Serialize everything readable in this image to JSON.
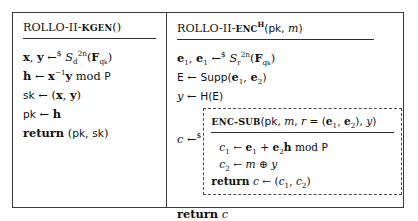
{
  "figure": {
    "kind": "algorithm-pseudocode-figure",
    "columns": [
      {
        "id": "kgen",
        "header": {
          "name": "ROLLO-II-KGen",
          "small_caps_part": "KGen",
          "args": "()",
          "full": "ROLLO-II-KGen()"
        },
        "lines": [
          {
            "id": "sample-xy",
            "text": "x, y ←$ S_d^{2n}(F_{q^k})"
          },
          {
            "id": "compute-h",
            "text": "h ← x^{-1}y mod P"
          },
          {
            "id": "set-sk",
            "text": "sk ← (x, y)"
          },
          {
            "id": "set-pk",
            "text": "pk ← h"
          },
          {
            "id": "return-keys",
            "text": "return (pk, sk)"
          }
        ]
      },
      {
        "id": "enc",
        "header": {
          "name": "ROLLO-II-Enc",
          "small_caps_part": "Enc",
          "superscript": "H",
          "args": "(pk, m)",
          "full": "ROLLO-II-Enc^H(pk, m)"
        },
        "lines": [
          {
            "id": "sample-e",
            "text": "e₁, e₁ ←$ S_r^{2n}(F_{q^k})"
          },
          {
            "id": "compute-E",
            "text": "E ← Supp(e₁, e₂)"
          },
          {
            "id": "compute-y",
            "text": "y ← H(E)"
          }
        ],
        "enc_sub": {
          "assign": "c ←$",
          "header": "Enc-Sub(pk, m, r = (e₁, e₂), y)",
          "lines": [
            {
              "id": "compute-c1",
              "text": "c₁ ← e₁ + e₂h mod P"
            },
            {
              "id": "compute-c2",
              "text": "c₂ ← m ⊕ y"
            },
            {
              "id": "return-c-pair",
              "text": "return c ← (c₁, c₂)"
            }
          ]
        },
        "final_line": {
          "id": "return-c",
          "text": "return c"
        }
      }
    ],
    "symbols": {
      "left_arrow": "←",
      "random_assign": "←$",
      "xor": "⊕",
      "blackboard_F": "𝔽",
      "script_S": "𝒞"
    },
    "colors": {
      "frame": "#3a3a3a",
      "dashed_box": "#4a4a4a",
      "rule": "#2e2e2e",
      "text": "#111111",
      "background": "#ffffff"
    }
  }
}
